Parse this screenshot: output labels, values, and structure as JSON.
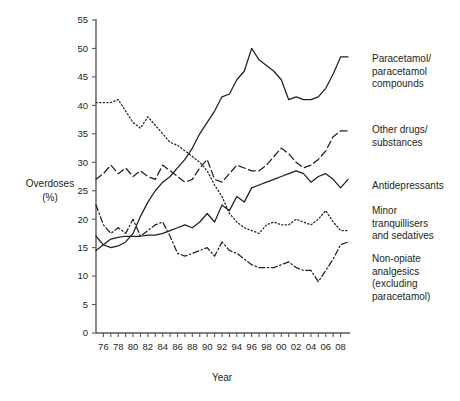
{
  "chart_data": {
    "type": "line",
    "title": "",
    "xlabel": "Year",
    "ylabel": "Overdoses (%)",
    "ylabel_line1": "Overdoses",
    "ylabel_line2": "(%)",
    "ylim": [
      0,
      55
    ],
    "xlim": [
      1975,
      2009
    ],
    "grid": false,
    "legend_position": "right",
    "ytick_labels": [
      "0",
      "5",
      "10",
      "15",
      "20",
      "25",
      "30",
      "35",
      "40",
      "45",
      "50",
      "55"
    ],
    "ytick_values": [
      0,
      5,
      10,
      15,
      20,
      25,
      30,
      35,
      40,
      45,
      50,
      55
    ],
    "xtick_labels": [
      "76",
      "78",
      "80",
      "82",
      "84",
      "86",
      "88",
      "90",
      "92",
      "94",
      "96",
      "98",
      "00",
      "02",
      "04",
      "06",
      "08"
    ],
    "xtick_values": [
      1976,
      1978,
      1980,
      1982,
      1984,
      1986,
      1988,
      1990,
      1992,
      1994,
      1996,
      1998,
      2000,
      2002,
      2004,
      2006,
      2008
    ],
    "x": [
      1975,
      1976,
      1977,
      1978,
      1979,
      1980,
      1981,
      1982,
      1983,
      1984,
      1985,
      1986,
      1987,
      1988,
      1989,
      1990,
      1991,
      1992,
      1993,
      1994,
      1995,
      1996,
      1997,
      1998,
      1999,
      2000,
      2001,
      2002,
      2003,
      2004,
      2005,
      2006,
      2007,
      2008,
      2009
    ],
    "series": [
      {
        "name": "Paracetamol/paracetamol compounds",
        "style": "solid",
        "legend_label_lines": [
          "Paracetamol/",
          "paracetamol",
          "compounds"
        ],
        "values": [
          17.0,
          15.5,
          15.0,
          15.3,
          16.0,
          17.5,
          20.5,
          23.0,
          25.0,
          26.5,
          27.5,
          29.0,
          30.5,
          32.5,
          35.0,
          37.0,
          39.0,
          41.5,
          42.0,
          44.5,
          46.0,
          50.0,
          48.0,
          47.0,
          46.0,
          44.5,
          41.0,
          41.5,
          41.0,
          41.0,
          41.5,
          43.0,
          45.5,
          48.5,
          48.5
        ]
      },
      {
        "name": "Other drugs/substances",
        "style": "dashed",
        "legend_label_lines": [
          "Other drugs/",
          "substances"
        ],
        "values": [
          27.0,
          28.0,
          29.5,
          28.0,
          29.0,
          27.5,
          28.5,
          27.5,
          27.0,
          29.5,
          28.5,
          27.5,
          26.5,
          27.0,
          29.0,
          30.5,
          27.0,
          26.5,
          28.0,
          29.5,
          29.0,
          28.5,
          28.5,
          29.5,
          31.0,
          32.5,
          31.5,
          30.0,
          29.0,
          29.5,
          30.5,
          32.0,
          34.5,
          35.5,
          35.5
        ]
      },
      {
        "name": "Antidepressants",
        "style": "solid",
        "legend_label_lines": [
          "Antidepressants"
        ],
        "values": [
          14.5,
          15.5,
          16.5,
          16.8,
          17.0,
          17.0,
          17.0,
          17.2,
          17.2,
          17.5,
          18.0,
          18.5,
          19.0,
          18.5,
          19.5,
          21.0,
          19.5,
          22.5,
          21.5,
          24.0,
          23.0,
          25.5,
          26.0,
          26.5,
          27.0,
          27.5,
          28.0,
          28.5,
          28.0,
          26.5,
          27.5,
          28.0,
          27.0,
          25.5,
          27.0
        ]
      },
      {
        "name": "Minor tranquillisers and sedatives",
        "style": "dotted",
        "legend_label_lines": [
          "Minor",
          "tranquillisers",
          "and sedatives"
        ],
        "values": [
          40.5,
          40.5,
          40.5,
          41.0,
          39.0,
          37.0,
          36.0,
          38.0,
          36.5,
          35.0,
          33.5,
          33.0,
          32.0,
          31.0,
          30.0,
          28.5,
          26.0,
          24.0,
          21.0,
          19.5,
          18.5,
          18.0,
          17.5,
          19.0,
          19.5,
          19.0,
          19.0,
          20.0,
          19.5,
          19.0,
          20.0,
          21.5,
          19.5,
          18.0,
          18.0
        ]
      },
      {
        "name": "Non-opiate analgesics (excluding paracetamol)",
        "style": "dashdot",
        "legend_label_lines": [
          "Non-opiate",
          "analgesics",
          "(excluding",
          "paracetamol)"
        ],
        "values": [
          22.5,
          19.0,
          17.5,
          18.5,
          17.5,
          20.0,
          17.0,
          18.0,
          19.0,
          19.5,
          17.0,
          14.0,
          13.5,
          14.0,
          14.5,
          15.0,
          13.5,
          16.0,
          14.5,
          14.0,
          13.0,
          12.0,
          11.5,
          11.5,
          11.5,
          12.0,
          12.5,
          11.5,
          11.0,
          11.0,
          9.0,
          11.0,
          13.0,
          15.5,
          16.0
        ]
      }
    ]
  }
}
